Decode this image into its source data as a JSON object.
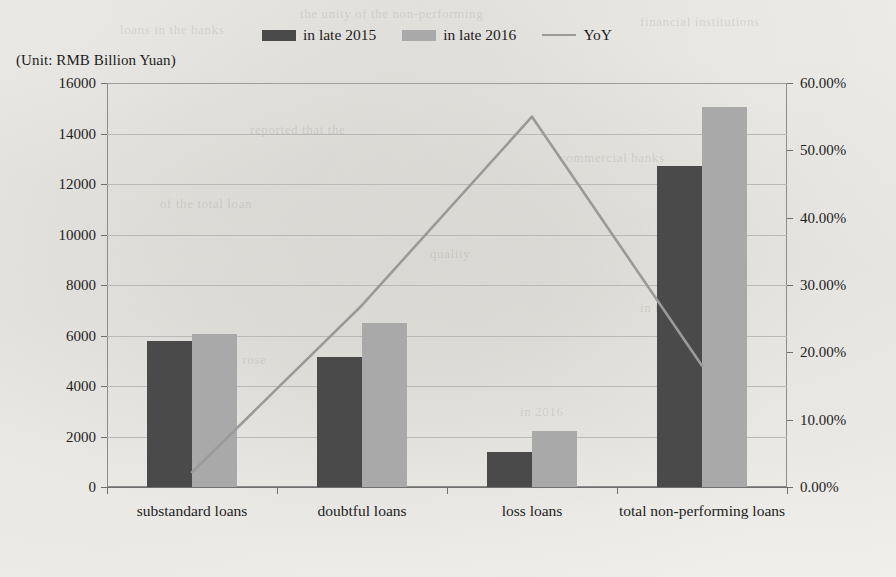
{
  "unit_note": "(Unit: RMB Billion Yuan)",
  "legend": {
    "position": "top-center",
    "items": [
      {
        "label": "in late 2015",
        "marker": "square-swatch",
        "color": "#4a4a4a"
      },
      {
        "label": "in late 2016",
        "marker": "square-swatch",
        "color": "#a9a9a9"
      },
      {
        "label": "YoY",
        "marker": "line-swatch",
        "color": "#9a9a9a"
      }
    ]
  },
  "chart_data": {
    "type": "bar",
    "title": "",
    "subtitle": "",
    "xlabel": "",
    "ylabel": "(Unit: RMB Billion Yuan)",
    "categories": [
      "substandard loans",
      "doubtful loans",
      "loss loans",
      "total non-performing loans"
    ],
    "series": [
      {
        "name": "in late 2015",
        "type": "bar",
        "axis": "left",
        "color": "#4a4a4a",
        "values": [
          5800,
          5150,
          1400,
          12700
        ]
      },
      {
        "name": "in late 2016",
        "type": "bar",
        "axis": "left",
        "color": "#a9a9a9",
        "values": [
          6050,
          6500,
          2200,
          15050
        ]
      },
      {
        "name": "YoY",
        "type": "line",
        "axis": "right",
        "color": "#9a9a9a",
        "values": [
          2.2,
          27.0,
          55.0,
          18.0
        ]
      }
    ],
    "y_left": {
      "label": "(Unit: RMB Billion Yuan)",
      "ylim": [
        0,
        16000
      ],
      "step": 2000,
      "ticks": [
        "0",
        "2000",
        "4000",
        "6000",
        "8000",
        "10000",
        "12000",
        "14000",
        "16000"
      ],
      "tick_values": [
        0,
        2000,
        4000,
        6000,
        8000,
        10000,
        12000,
        14000,
        16000
      ]
    },
    "y_right": {
      "label": "",
      "ylim": [
        0,
        60
      ],
      "step": 10,
      "ticks": [
        "0.00%",
        "10.00%",
        "20.00%",
        "30.00%",
        "40.00%",
        "50.00%",
        "60.00%"
      ],
      "tick_values": [
        0,
        10,
        20,
        30,
        40,
        50,
        60
      ]
    },
    "grid": true,
    "legend_position": "top-center"
  },
  "ghost_text": [
    {
      "text": "the unity of the non-performing",
      "x": 300,
      "y": 6
    },
    {
      "text": "loans in the banks",
      "x": 120,
      "y": 22
    },
    {
      "text": "financial institutions",
      "x": 640,
      "y": 14
    },
    {
      "text": "reported that the",
      "x": 250,
      "y": 122
    },
    {
      "text": "commercial banks",
      "x": 560,
      "y": 150
    },
    {
      "text": "of the total loan",
      "x": 160,
      "y": 196
    },
    {
      "text": "quality",
      "x": 430,
      "y": 246
    },
    {
      "text": "in recent years",
      "x": 640,
      "y": 300
    },
    {
      "text": "the ratio rose",
      "x": 190,
      "y": 352
    },
    {
      "text": "in 2016",
      "x": 520,
      "y": 404
    }
  ]
}
